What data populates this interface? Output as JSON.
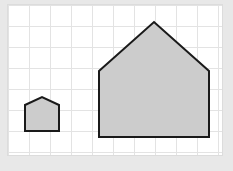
{
  "figure": {
    "title": "Two similar house-shaped polygons on a square grid",
    "background_color": "#e8e8e8",
    "panel_background_color": "#ffffff",
    "panel": {
      "x": 8,
      "y": 5,
      "width": 214,
      "height": 150
    },
    "grid": {
      "visible": true,
      "line_color": "#e3e3e3",
      "cell_size": 21,
      "columns": 10,
      "rows": 7,
      "x_positions": [
        0,
        21,
        42,
        63,
        84,
        105,
        126,
        147,
        168,
        189,
        210
      ],
      "y_positions": [
        0,
        21,
        42,
        63,
        84,
        105,
        126,
        147
      ]
    },
    "shapes": [
      {
        "name": "small-house",
        "label": "Small house",
        "fill_color": "#cccccc",
        "stroke_color": "#1a1a1a",
        "stroke_width": 2,
        "points": "17,100 34,92 51,100 51,126 17,126",
        "vertices": [
          {
            "name": "left-eave",
            "x": 17,
            "y": 100
          },
          {
            "name": "apex",
            "x": 34,
            "y": 92
          },
          {
            "name": "right-eave",
            "x": 51,
            "y": 100
          },
          {
            "name": "bottom-right",
            "x": 51,
            "y": 126
          },
          {
            "name": "bottom-left",
            "x": 17,
            "y": 126
          }
        ],
        "width_units": 1.6,
        "height_units": 1.6
      },
      {
        "name": "large-house",
        "label": "Large house",
        "fill_color": "#cccccc",
        "stroke_color": "#1a1a1a",
        "stroke_width": 2,
        "points": "91,66 146,17 201,66 201,132 91,132",
        "vertices": [
          {
            "name": "left-eave",
            "x": 91,
            "y": 66
          },
          {
            "name": "apex",
            "x": 146,
            "y": 17
          },
          {
            "name": "right-eave",
            "x": 201,
            "y": 66
          },
          {
            "name": "bottom-right",
            "x": 201,
            "y": 132
          },
          {
            "name": "bottom-left",
            "x": 91,
            "y": 132
          }
        ],
        "width_units": 5.2,
        "height_units": 5.5
      }
    ]
  }
}
